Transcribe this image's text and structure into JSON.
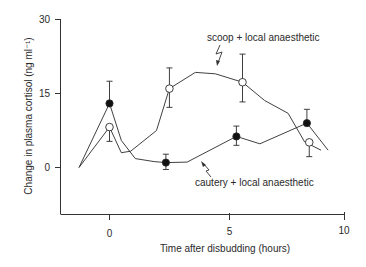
{
  "chart_data": {
    "type": "line",
    "title": "",
    "xlabel": "Time after disbudding (hours)",
    "ylabel": "Change in plasma cortisol (ng ml⁻¹)",
    "xlim": [
      -1.6,
      10
    ],
    "ylim": [
      -9.5,
      30
    ],
    "x_ticks": [
      0,
      5,
      10
    ],
    "y_ticks": [
      0,
      15,
      30
    ],
    "grid": false,
    "legend": "inline annotations",
    "series": [
      {
        "name": "scoop + local anaesthetic",
        "marker": "open-circle",
        "line": [
          [
            -1.3,
            0
          ],
          [
            0,
            8.2
          ],
          [
            0.5,
            3
          ],
          [
            0.9,
            3.3
          ],
          [
            2.0,
            7.5
          ],
          [
            2.55,
            16
          ],
          [
            3.65,
            19.3
          ],
          [
            4.5,
            19
          ],
          [
            5.66,
            17.3
          ],
          [
            6.6,
            13.6
          ],
          [
            7.6,
            11
          ],
          [
            8.3,
            5.2
          ],
          [
            9.0,
            3.5
          ]
        ],
        "points": [
          {
            "x": 0,
            "y": 8.2,
            "err_low": 5.3,
            "err_high": 8.2
          },
          {
            "x": 2.55,
            "y": 16,
            "err_low": 12.2,
            "err_high": 20.2
          },
          {
            "x": 5.66,
            "y": 17.3,
            "err_low": 13.3,
            "err_high": 23
          },
          {
            "x": 8.5,
            "y": 5.1,
            "err_low": 2.2,
            "err_high": 5.1
          }
        ]
      },
      {
        "name": "cautery + local anaesthetic",
        "marker": "filled-circle",
        "line": [
          [
            -1.3,
            0
          ],
          [
            0,
            13
          ],
          [
            0.5,
            5.5
          ],
          [
            1.1,
            1.8
          ],
          [
            1.9,
            1.2
          ],
          [
            2.4,
            1
          ],
          [
            3.3,
            1.1
          ],
          [
            5.4,
            6.3
          ],
          [
            6.4,
            4.8
          ],
          [
            8.4,
            9
          ],
          [
            9.3,
            3.5
          ]
        ],
        "points": [
          {
            "x": 0,
            "y": 13,
            "err_low": 13,
            "err_high": 17.5
          },
          {
            "x": 2.4,
            "y": 1,
            "err_low": -0.4,
            "err_high": 2.7
          },
          {
            "x": 5.4,
            "y": 6.3,
            "err_low": 4.5,
            "err_high": 8.4
          },
          {
            "x": 8.4,
            "y": 9,
            "err_low": 9,
            "err_high": 11.8
          }
        ]
      }
    ],
    "annotations": [
      {
        "text": "scoop + local anaesthetic",
        "target_series": 0
      },
      {
        "text": "cautery + local anaesthetic",
        "target_series": 1
      }
    ]
  },
  "labels": {
    "y_axis": "Change in plasma cortisol (ng ml⁻¹)",
    "x_axis": "Time after disbudding (hours)",
    "scoop": "scoop + local anaesthetic",
    "cautery": "cautery + local anaesthetic",
    "y_tick_0": "0",
    "y_tick_15": "15",
    "y_tick_30": "30",
    "x_tick_0": "0",
    "x_tick_5": "5",
    "x_tick_10": "10"
  },
  "colors": {
    "ink": "#2a2a2a",
    "background": "#ffffff"
  }
}
